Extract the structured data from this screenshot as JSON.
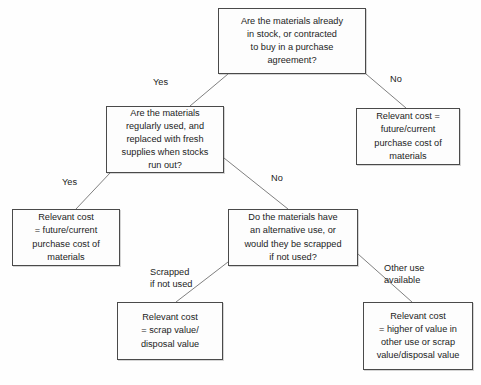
{
  "diagram": {
    "type": "decision-tree",
    "background_color": "#fefefe",
    "box_border_color": "#4a4a4a",
    "connector_color": "#808080",
    "text_color": "#1c1c1c",
    "nodes": [
      {
        "id": "q1",
        "kind": "decision",
        "text": "Are the materials already\nin stock, or contracted\nto buy in a purchase\nagreement?",
        "x": 218,
        "y": 8,
        "w": 148,
        "h": 66
      },
      {
        "id": "q2",
        "kind": "decision",
        "text": "Are the materials\nregularly used, and\nreplaced with fresh\nsupplies when stocks\nrun out?",
        "x": 106,
        "y": 106,
        "w": 118,
        "h": 67
      },
      {
        "id": "r1",
        "kind": "outcome",
        "text": "Relevant cost =\nfuture/current\npurchase cost of\nmaterials",
        "x": 356,
        "y": 108,
        "w": 104,
        "h": 57
      },
      {
        "id": "r2",
        "kind": "outcome",
        "text": "Relevant cost\n= future/current\npurchase cost of\nmaterials",
        "x": 12,
        "y": 209,
        "w": 108,
        "h": 57
      },
      {
        "id": "q3",
        "kind": "decision",
        "text": "Do the materials have\nan alternative use, or\nwould they be scrapped\nif not used?",
        "x": 228,
        "y": 209,
        "w": 130,
        "h": 57
      },
      {
        "id": "r3",
        "kind": "outcome",
        "text": "Relevant cost\n= scrap value/\ndisposal value",
        "x": 117,
        "y": 302,
        "w": 106,
        "h": 58
      },
      {
        "id": "r4",
        "kind": "outcome",
        "text": "Relevant cost\n= higher of value in\nother use or scrap\nvalue/disposal value",
        "x": 363,
        "y": 302,
        "w": 110,
        "h": 68
      }
    ],
    "edge_labels": [
      {
        "id": "yes-1",
        "text": "Yes",
        "x": 153,
        "y": 76
      },
      {
        "id": "no-1",
        "text": "No",
        "x": 390,
        "y": 73
      },
      {
        "id": "yes-2",
        "text": "Yes",
        "x": 62,
        "y": 176
      },
      {
        "id": "no-2",
        "text": "No",
        "x": 271,
        "y": 172
      },
      {
        "id": "scrapped-if-not-used",
        "text": "Scrapped\nif not used",
        "x": 150,
        "y": 266
      },
      {
        "id": "other-use-available",
        "text": "Other use\navailable",
        "x": 384,
        "y": 262
      }
    ],
    "connectors": [
      {
        "id": "q1-to-q2",
        "from": "q1",
        "to": "q2",
        "label": "Yes",
        "x1": 228,
        "y1": 74,
        "x2": 190,
        "y2": 106
      },
      {
        "id": "q1-to-r1",
        "from": "q1",
        "to": "r1",
        "label": "No",
        "x1": 366,
        "y1": 74,
        "x2": 406,
        "y2": 108
      },
      {
        "id": "q2-to-r2",
        "from": "q2",
        "to": "r2",
        "label": "Yes",
        "x1": 110,
        "y1": 173,
        "x2": 76,
        "y2": 209
      },
      {
        "id": "q2-to-q3",
        "from": "q2",
        "to": "q3",
        "label": "No",
        "x1": 224,
        "y1": 158,
        "x2": 288,
        "y2": 209
      },
      {
        "id": "q3-to-r3",
        "from": "q3",
        "to": "r3",
        "label": "Scrapped if not used",
        "x1": 228,
        "y1": 262,
        "x2": 176,
        "y2": 302
      },
      {
        "id": "q3-to-r4",
        "from": "q3",
        "to": "r4",
        "label": "Other use available",
        "x1": 358,
        "y1": 254,
        "x2": 412,
        "y2": 302
      }
    ]
  }
}
